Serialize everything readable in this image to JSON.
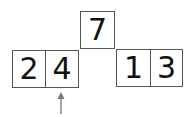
{
  "diagram": {
    "top": {
      "value": "7"
    },
    "left": {
      "cells": [
        "2",
        "4"
      ]
    },
    "right": {
      "cells": [
        "1",
        "3"
      ]
    },
    "pointer": {
      "target": "4",
      "color": "#777777"
    }
  }
}
